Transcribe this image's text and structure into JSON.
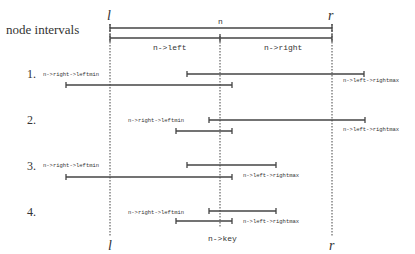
{
  "title": "node intervals",
  "bounds": {
    "left_label": "l",
    "right_label": "r",
    "l_x": 110,
    "r_x": 332,
    "key_x": 220
  },
  "header": {
    "n_label": "n",
    "n_left_label": "n->left",
    "n_right_label": "n->right"
  },
  "key_label": "n->key",
  "cases": [
    {
      "number": "1.",
      "leftmin_label": "n->right->leftmin",
      "rightmax_label": "n->left->rightmax",
      "right_interval": {
        "x1": 187,
        "x2": 364
      },
      "left_interval": {
        "x1": 66,
        "x2": 232
      }
    },
    {
      "number": "2.",
      "leftmin_label": "n->right->leftmin",
      "rightmax_label": "n->left->rightmax",
      "right_interval": {
        "x1": 209,
        "x2": 365
      },
      "left_interval": {
        "x1": 176,
        "x2": 232
      }
    },
    {
      "number": "3.",
      "leftmin_label": "n->right->leftmin",
      "rightmax_label": "n->left->rightmax",
      "right_interval": {
        "x1": 187,
        "x2": 276
      },
      "left_interval": {
        "x1": 66,
        "x2": 232
      }
    },
    {
      "number": "4.",
      "leftmin_label": "n->right->leftmin",
      "rightmax_label": "n->left->rightmax",
      "right_interval": {
        "x1": 209,
        "x2": 276
      },
      "left_interval": {
        "x1": 176,
        "x2": 232
      }
    }
  ],
  "colors": {
    "line": "#444444",
    "text": "#333333",
    "background": "#ffffff"
  }
}
